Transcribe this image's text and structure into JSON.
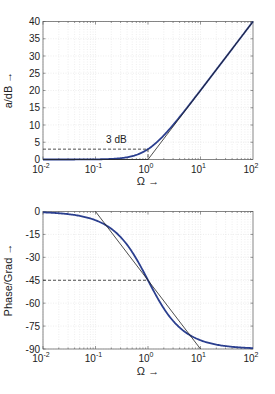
{
  "chart_data": [
    {
      "type": "line",
      "title": "",
      "xlabel": "Ω →",
      "ylabel": "a/dB →",
      "xscale": "log",
      "xlim": [
        0.01,
        100
      ],
      "ylim": [
        0,
        40
      ],
      "xticks": [
        0.01,
        0.1,
        1,
        10,
        100
      ],
      "xtick_labels": [
        "10^-2",
        "10^-1",
        "10^0",
        "10^1",
        "10^2"
      ],
      "yticks": [
        0,
        5,
        10,
        15,
        20,
        25,
        30,
        35,
        40
      ],
      "ytick_labels": [
        "0",
        "5",
        "10",
        "15",
        "20",
        "25",
        "30",
        "35",
        "40"
      ],
      "grid": true,
      "series": [
        {
          "name": "attenuation",
          "color": "#2b3f8f",
          "style": "solid",
          "x": [
            0.01,
            0.02,
            0.05,
            0.1,
            0.2,
            0.3,
            0.5,
            0.7,
            1,
            1.5,
            2,
            3,
            5,
            7,
            10,
            20,
            50,
            100
          ],
          "y": [
            0.0004,
            0.0017,
            0.011,
            0.043,
            0.17,
            0.37,
            0.97,
            1.73,
            3.01,
            5.12,
            6.99,
            10.0,
            14.15,
            17.0,
            20.04,
            26.03,
            33.98,
            40.0
          ]
        },
        {
          "name": "asymptote",
          "color": "#222222",
          "style": "solid",
          "x": [
            0.01,
            1,
            100
          ],
          "y": [
            0,
            0,
            40
          ]
        },
        {
          "name": "3dB-marker",
          "color": "#222222",
          "style": "dashed",
          "x": [
            0.01,
            1,
            1
          ],
          "y": [
            3,
            3,
            0
          ]
        }
      ],
      "annotations": [
        {
          "text": "3 dB",
          "x": 0.25,
          "y": 5
        }
      ]
    },
    {
      "type": "line",
      "title": "",
      "xlabel": "Ω →",
      "ylabel": "Phase/Grad →",
      "xscale": "log",
      "xlim": [
        0.01,
        100
      ],
      "ylim": [
        -90,
        0
      ],
      "xticks": [
        0.01,
        0.1,
        1,
        10,
        100
      ],
      "xtick_labels": [
        "10^-2",
        "10^-1",
        "10^0",
        "10^1",
        "10^2"
      ],
      "yticks": [
        -90,
        -75,
        -60,
        -45,
        -30,
        -15,
        0
      ],
      "ytick_labels": [
        "-90",
        "-75",
        "-60",
        "-45",
        "-30",
        "-15",
        "0"
      ],
      "grid": true,
      "series": [
        {
          "name": "phase",
          "color": "#2b3f8f",
          "style": "solid",
          "x": [
            0.01,
            0.02,
            0.05,
            0.1,
            0.2,
            0.3,
            0.5,
            0.7,
            1,
            1.5,
            2,
            3,
            5,
            7,
            10,
            20,
            50,
            100
          ],
          "y": [
            -0.57,
            -1.15,
            -2.86,
            -5.71,
            -11.31,
            -16.7,
            -26.57,
            -34.99,
            -45.0,
            -56.31,
            -63.43,
            -71.57,
            -78.69,
            -81.87,
            -84.29,
            -87.14,
            -88.85,
            -89.43
          ]
        },
        {
          "name": "asymptote",
          "color": "#222222",
          "style": "solid",
          "x": [
            0.1,
            10
          ],
          "y": [
            0,
            -90
          ]
        },
        {
          "name": "45deg-marker",
          "color": "#222222",
          "style": "dashed",
          "x": [
            0.01,
            1
          ],
          "y": [
            -45,
            -45
          ]
        }
      ]
    }
  ]
}
